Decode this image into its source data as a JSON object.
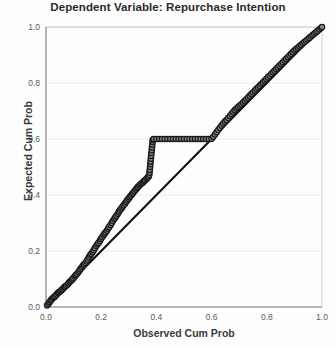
{
  "chart_data": {
    "type": "scatter",
    "title": "Dependent Variable: Repurchase Intention",
    "xlabel": "Observed Cum Prob",
    "ylabel": "Expected Cum Prob",
    "xlim": [
      0.0,
      1.0
    ],
    "ylim": [
      0.0,
      1.0
    ],
    "xticks": [
      "0.0",
      "0.2",
      "0.4",
      "0.6",
      "0.8",
      "1.0"
    ],
    "yticks": [
      "0.0",
      "0.2",
      "0.4",
      "0.6",
      "0.8",
      "1.0"
    ],
    "xtick_values": [
      0.0,
      0.2,
      0.4,
      0.6,
      0.8,
      1.0
    ],
    "ytick_values": [
      0.0,
      0.2,
      0.4,
      0.6,
      0.8,
      1.0
    ],
    "grid": true,
    "grid_color": "#ececec",
    "legend": false,
    "marker_fill": "#8c8c8c",
    "marker_edge": "#1a1a1a",
    "marker_size": 4.2,
    "reference_line_color": "#111111",
    "reference_line": {
      "x": [
        0.0,
        1.0
      ],
      "y": [
        0.0,
        1.0
      ]
    },
    "series": [
      {
        "name": "Normal P-P of Regression Standardized Residual",
        "x": [
          0.004,
          0.009,
          0.013,
          0.017,
          0.021,
          0.026,
          0.03,
          0.034,
          0.039,
          0.043,
          0.047,
          0.052,
          0.056,
          0.06,
          0.065,
          0.069,
          0.073,
          0.078,
          0.082,
          0.086,
          0.091,
          0.095,
          0.099,
          0.104,
          0.108,
          0.112,
          0.117,
          0.121,
          0.125,
          0.13,
          0.134,
          0.138,
          0.143,
          0.147,
          0.151,
          0.156,
          0.16,
          0.164,
          0.169,
          0.173,
          0.177,
          0.182,
          0.186,
          0.19,
          0.195,
          0.199,
          0.203,
          0.208,
          0.212,
          0.216,
          0.221,
          0.225,
          0.229,
          0.234,
          0.238,
          0.242,
          0.247,
          0.251,
          0.255,
          0.26,
          0.264,
          0.268,
          0.273,
          0.277,
          0.281,
          0.286,
          0.29,
          0.294,
          0.299,
          0.303,
          0.307,
          0.312,
          0.316,
          0.32,
          0.325,
          0.329,
          0.333,
          0.338,
          0.342,
          0.346,
          0.351,
          0.355,
          0.359,
          0.364,
          0.368,
          0.372,
          0.374,
          0.375,
          0.376,
          0.377,
          0.378,
          0.379,
          0.38,
          0.381,
          0.382,
          0.383,
          0.384,
          0.385,
          0.386,
          0.387,
          0.39,
          0.4,
          0.41,
          0.42,
          0.43,
          0.44,
          0.45,
          0.46,
          0.47,
          0.48,
          0.49,
          0.5,
          0.51,
          0.52,
          0.53,
          0.54,
          0.55,
          0.56,
          0.57,
          0.58,
          0.59,
          0.6,
          0.606,
          0.612,
          0.618,
          0.624,
          0.63,
          0.636,
          0.642,
          0.648,
          0.654,
          0.66,
          0.666,
          0.672,
          0.678,
          0.684,
          0.69,
          0.696,
          0.702,
          0.708,
          0.714,
          0.72,
          0.726,
          0.732,
          0.738,
          0.744,
          0.75,
          0.756,
          0.762,
          0.768,
          0.774,
          0.78,
          0.786,
          0.792,
          0.798,
          0.804,
          0.81,
          0.816,
          0.822,
          0.828,
          0.834,
          0.84,
          0.846,
          0.852,
          0.858,
          0.864,
          0.87,
          0.876,
          0.882,
          0.888,
          0.894,
          0.9,
          0.906,
          0.912,
          0.918,
          0.924,
          0.93,
          0.936,
          0.942,
          0.948,
          0.954,
          0.96,
          0.966,
          0.972,
          0.978,
          0.984,
          0.99,
          0.996,
          1.0
        ],
        "y": [
          0.006,
          0.012,
          0.018,
          0.023,
          0.028,
          0.033,
          0.036,
          0.04,
          0.045,
          0.05,
          0.053,
          0.056,
          0.06,
          0.064,
          0.069,
          0.073,
          0.076,
          0.08,
          0.085,
          0.09,
          0.094,
          0.098,
          0.103,
          0.109,
          0.114,
          0.118,
          0.124,
          0.13,
          0.136,
          0.142,
          0.148,
          0.152,
          0.157,
          0.163,
          0.17,
          0.178,
          0.185,
          0.19,
          0.196,
          0.203,
          0.21,
          0.218,
          0.224,
          0.229,
          0.236,
          0.243,
          0.249,
          0.256,
          0.262,
          0.267,
          0.273,
          0.28,
          0.286,
          0.293,
          0.3,
          0.307,
          0.314,
          0.32,
          0.326,
          0.333,
          0.34,
          0.346,
          0.352,
          0.358,
          0.363,
          0.369,
          0.375,
          0.381,
          0.387,
          0.392,
          0.397,
          0.403,
          0.408,
          0.413,
          0.419,
          0.424,
          0.429,
          0.434,
          0.438,
          0.441,
          0.445,
          0.449,
          0.453,
          0.458,
          0.462,
          0.466,
          0.472,
          0.48,
          0.49,
          0.5,
          0.51,
          0.52,
          0.53,
          0.54,
          0.55,
          0.56,
          0.57,
          0.58,
          0.59,
          0.597,
          0.6,
          0.6,
          0.6,
          0.6,
          0.6,
          0.6,
          0.6,
          0.6,
          0.6,
          0.6,
          0.6,
          0.6,
          0.6,
          0.6,
          0.6,
          0.6,
          0.6,
          0.6,
          0.6,
          0.6,
          0.6,
          0.601,
          0.608,
          0.616,
          0.624,
          0.632,
          0.64,
          0.648,
          0.655,
          0.662,
          0.668,
          0.675,
          0.682,
          0.689,
          0.696,
          0.703,
          0.709,
          0.714,
          0.719,
          0.724,
          0.73,
          0.736,
          0.742,
          0.748,
          0.754,
          0.76,
          0.766,
          0.772,
          0.778,
          0.784,
          0.79,
          0.796,
          0.802,
          0.808,
          0.814,
          0.82,
          0.826,
          0.832,
          0.838,
          0.844,
          0.85,
          0.856,
          0.862,
          0.868,
          0.874,
          0.88,
          0.886,
          0.892,
          0.898,
          0.904,
          0.91,
          0.916,
          0.921,
          0.926,
          0.931,
          0.936,
          0.941,
          0.946,
          0.951,
          0.956,
          0.961,
          0.966,
          0.971,
          0.976,
          0.981,
          0.986,
          0.991,
          0.996,
          1.0
        ]
      }
    ]
  }
}
